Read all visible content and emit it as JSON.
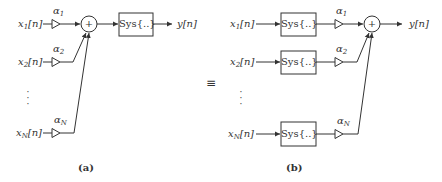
{
  "diagram_a": {
    "caption": "(a)",
    "inputs": [
      {
        "base": "x",
        "sub": "1",
        "arg": "[n]",
        "gain_base": "α",
        "gain_sub": "1"
      },
      {
        "base": "x",
        "sub": "2",
        "arg": "[n]",
        "gain_base": "α",
        "gain_sub": "2"
      },
      {
        "base": "x",
        "sub": "N",
        "arg": "[n]",
        "gain_base": "α",
        "gain_sub": "N"
      }
    ],
    "sum_symbol": "+",
    "system_label": "Sys{..}",
    "output": "y[n]",
    "ellipsis": "⋮"
  },
  "equivalence": "≡",
  "diagram_b": {
    "caption": "(b)",
    "inputs": [
      {
        "base": "x",
        "sub": "1",
        "arg": "[n]",
        "system_label": "Sys{..}",
        "gain_base": "α",
        "gain_sub": "1"
      },
      {
        "base": "x",
        "sub": "2",
        "arg": "[n]",
        "system_label": "Sys{..}",
        "gain_base": "α",
        "gain_sub": "2"
      },
      {
        "base": "x",
        "sub": "N",
        "arg": "[n]",
        "system_label": "Sys{..}",
        "gain_base": "α",
        "gain_sub": "N"
      }
    ],
    "sum_symbol": "+",
    "output": "y[n]",
    "ellipsis": "⋮"
  },
  "colors": {
    "stroke": "#333333",
    "background": "#ffffff"
  }
}
